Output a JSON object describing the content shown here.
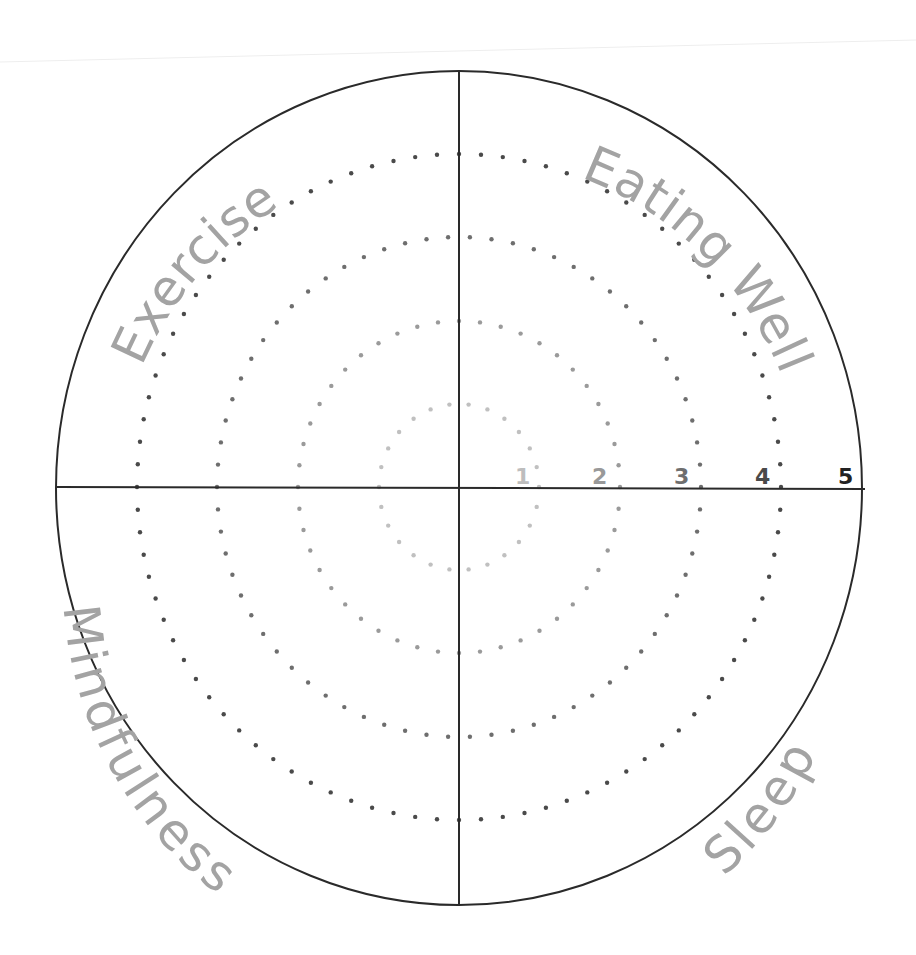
{
  "categories": [
    {
      "key": "exercise",
      "label": "Exercise",
      "quadrant": "top-left"
    },
    {
      "key": "eating_well",
      "label": "Eating Well",
      "quadrant": "top-right"
    },
    {
      "key": "mindfulness",
      "label": "Mindfulness",
      "quadrant": "bottom-left"
    },
    {
      "key": "sleep",
      "label": "Sleep",
      "quadrant": "bottom-right"
    }
  ],
  "scale": {
    "ticks": [
      {
        "value": "1",
        "color": "#bdbdbd"
      },
      {
        "value": "2",
        "color": "#999999"
      },
      {
        "value": "3",
        "color": "#6e6e6e"
      },
      {
        "value": "4",
        "color": "#4a4a4a"
      },
      {
        "value": "5",
        "color": "#222222"
      }
    ]
  },
  "colors": {
    "outline": "#2a2a2a",
    "label": "#a3a3a3",
    "ring_dots": [
      "#c0c0c0",
      "#9a9a9a",
      "#6e6e6e",
      "#4a4a4a"
    ]
  }
}
